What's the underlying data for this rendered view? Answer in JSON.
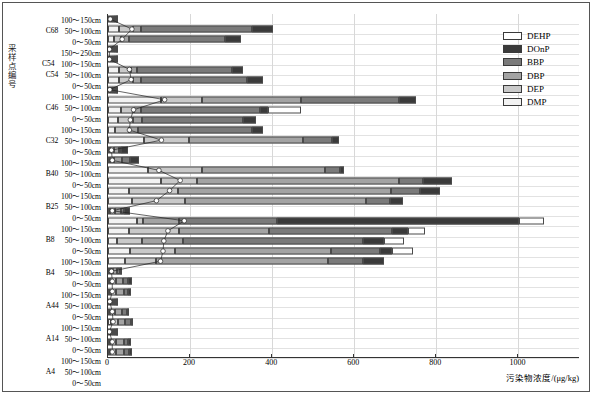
{
  "axes": {
    "y_axis_title": "采样点编号",
    "x_axis_title": "污染物浓度/(μg/kg)",
    "x_ticks": [
      "0",
      "200",
      "400",
      "600",
      "800",
      "1000"
    ]
  },
  "legend": {
    "items": [
      {
        "label": "DEHP",
        "color": "#ffffff"
      },
      {
        "label": "DOnP",
        "color": "#3a3a3a"
      },
      {
        "label": "BBP",
        "color": "#7a7a7a"
      },
      {
        "label": "DBP",
        "color": "#a3a3a3"
      },
      {
        "label": "DEP",
        "color": "#c9c9c9"
      },
      {
        "label": "DMP",
        "color": "#f2f2f2"
      }
    ]
  },
  "chart_data": {
    "type": "bar",
    "orientation": "horizontal",
    "stacked": true,
    "title": "",
    "xlabel": "污染物浓度/(μg/kg)",
    "ylabel": "采样点编号",
    "xlim": [
      0,
      1150
    ],
    "grid": true,
    "legend_position": "top-right",
    "series_order": [
      "DMP",
      "DEP",
      "DBP",
      "BBP",
      "DOnP",
      "DEHP"
    ],
    "series_colors": {
      "DMP": "#f2f2f2",
      "DEP": "#c9c9c9",
      "DBP": "#a3a3a3",
      "BBP": "#7a7a7a",
      "DOnP": "#3a3a3a",
      "DEHP": "#ffffff"
    },
    "categories": [
      {
        "group": "C68",
        "depth": "100～150cm"
      },
      {
        "group": "C68",
        "depth": "50～100cm"
      },
      {
        "group": "C68",
        "depth": "0～50cm"
      },
      {
        "group": "C54",
        "depth": "150～250cm"
      },
      {
        "group": "C54",
        "depth": "100～150cm"
      },
      {
        "group": "C54",
        "depth": "50～100cm"
      },
      {
        "group": "C54",
        "depth": "0～50cm"
      },
      {
        "group": "C46",
        "depth": "100～150cm"
      },
      {
        "group": "C46",
        "depth": "50～100cm"
      },
      {
        "group": "C46",
        "depth": "0～50cm"
      },
      {
        "group": "C32",
        "depth": "100～150cm"
      },
      {
        "group": "C32",
        "depth": "50～100cm"
      },
      {
        "group": "C32",
        "depth": "0～50cm"
      },
      {
        "group": "B40",
        "depth": "100～150cm"
      },
      {
        "group": "B40",
        "depth": "50～100cm"
      },
      {
        "group": "B40",
        "depth": "0～50cm"
      },
      {
        "group": "B25",
        "depth": "100～150cm"
      },
      {
        "group": "B25",
        "depth": "50～100cm"
      },
      {
        "group": "B25",
        "depth": "0～50cm"
      },
      {
        "group": "B8",
        "depth": "100～150cm"
      },
      {
        "group": "B8",
        "depth": "50～100cm"
      },
      {
        "group": "B8",
        "depth": "0～50cm"
      },
      {
        "group": "B4",
        "depth": "100～150cm"
      },
      {
        "group": "B4",
        "depth": "50～100cm"
      },
      {
        "group": "B4",
        "depth": "0～50cm"
      },
      {
        "group": "A44",
        "depth": "100～150cm"
      },
      {
        "group": "A44",
        "depth": "50～100cm"
      },
      {
        "group": "A44",
        "depth": "0～50cm"
      },
      {
        "group": "A14",
        "depth": "100～150cm"
      },
      {
        "group": "A14",
        "depth": "50～100cm"
      },
      {
        "group": "A14",
        "depth": "0～50cm"
      },
      {
        "group": "A4",
        "depth": "100～150cm"
      },
      {
        "group": "A4",
        "depth": "50～100cm"
      },
      {
        "group": "A4",
        "depth": "0～50cm"
      }
    ],
    "rows": [
      {
        "label": "C68 100～150cm",
        "values": {
          "DMP": 3,
          "DEP": 3,
          "DBP": 2,
          "BBP": 2,
          "DOnP": 2,
          "DEHP": 0
        },
        "marker": 5
      },
      {
        "label": "C68 50～100cm",
        "values": {
          "DMP": 28,
          "DEP": 34,
          "DBP": 18,
          "BBP": 270,
          "DOnP": 52,
          "DEHP": 0
        },
        "marker": 58
      },
      {
        "label": "C68 0～50cm",
        "values": {
          "DMP": 14,
          "DEP": 18,
          "DBP": 20,
          "BBP": 233,
          "DOnP": 40,
          "DEHP": 0
        },
        "marker": 34
      },
      {
        "label": "C54 150～250cm",
        "values": {
          "DMP": 2,
          "DEP": 2,
          "DBP": 2,
          "BBP": 1,
          "DOnP": 1,
          "DEHP": 0
        },
        "marker": 3
      },
      {
        "label": "C54 100～150cm",
        "values": {
          "DMP": 2,
          "DEP": 2,
          "DBP": 2,
          "BBP": 1,
          "DOnP": 1,
          "DEHP": 0
        },
        "marker": 3
      },
      {
        "label": "C54 50～100cm",
        "values": {
          "DMP": 26,
          "DEP": 30,
          "DBP": 15,
          "BBP": 230,
          "DOnP": 28,
          "DEHP": 0
        },
        "marker": 52
      },
      {
        "label": "C54 0～50cm",
        "values": {
          "DMP": 28,
          "DEP": 34,
          "DBP": 18,
          "BBP": 258,
          "DOnP": 40,
          "DEHP": 0
        },
        "marker": 56
      },
      {
        "label": "C46 100～150cm",
        "values": {
          "DMP": 2,
          "DEP": 2,
          "DBP": 2,
          "BBP": 2,
          "DOnP": 1,
          "DEHP": 0
        },
        "marker": 4
      },
      {
        "label": "C46 50～100cm",
        "values": {
          "DMP": 130,
          "DEP": 100,
          "DBP": 240,
          "BBP": 240,
          "DOnP": 40,
          "DEHP": 0
        },
        "marker": 138
      },
      {
        "label": "C46 0～50cm",
        "values": {
          "DMP": 32,
          "DEP": 32,
          "DBP": 16,
          "BBP": 290,
          "DOnP": 20,
          "DEHP": 80
        },
        "marker": 62
      },
      {
        "label": "C32 100～150cm",
        "values": {
          "DMP": 24,
          "DEP": 38,
          "DBP": 20,
          "BBP": 246,
          "DOnP": 32,
          "DEHP": 0
        },
        "marker": 54
      },
      {
        "label": "C32 50～100cm",
        "values": {
          "DMP": 18,
          "DEP": 34,
          "DBP": 20,
          "BBP": 280,
          "DOnP": 26,
          "DEHP": 0
        },
        "marker": 52
      },
      {
        "label": "C32 0～50cm",
        "values": {
          "DMP": 88,
          "DEP": 110,
          "DBP": 278,
          "BBP": 70,
          "DOnP": 16,
          "DEHP": 0
        },
        "marker": 130
      },
      {
        "label": "B40 100～150cm",
        "values": {
          "DMP": 4,
          "DEP": 10,
          "DBP": 12,
          "BBP": 6,
          "DOnP": 16,
          "DEHP": 0
        },
        "marker": 8
      },
      {
        "label": "B40 50～100cm",
        "values": {
          "DMP": 4,
          "DEP": 10,
          "DBP": 20,
          "BBP": 20,
          "DOnP": 22,
          "DEHP": 0
        },
        "marker": 10
      },
      {
        "label": "B40 0～50cm",
        "values": {
          "DMP": 98,
          "DEP": 130,
          "DBP": 300,
          "BBP": 38,
          "DOnP": 8,
          "DEHP": 0
        },
        "marker": 124
      },
      {
        "label": "B25 100～150cm",
        "values": {
          "DMP": 128,
          "DEP": 90,
          "DBP": 490,
          "BBP": 60,
          "DOnP": 70,
          "DEHP": 0
        },
        "marker": 176
      },
      {
        "label": "B25 50～100cm",
        "values": {
          "DMP": 50,
          "DEP": 120,
          "DBP": 520,
          "BBP": 70,
          "DOnP": 50,
          "DEHP": 0
        },
        "marker": 150
      },
      {
        "label": "B25 0～50cm",
        "values": {
          "DMP": 58,
          "DEP": 130,
          "DBP": 440,
          "BBP": 60,
          "DOnP": 30,
          "DEHP": 0
        },
        "marker": 118
      },
      {
        "label": "B8 100～150cm",
        "values": {
          "DMP": 6,
          "DEP": 12,
          "DBP": 14,
          "BBP": 6,
          "DOnP": 16,
          "DEHP": 0
        },
        "marker": 10
      },
      {
        "label": "B8 50～100cm",
        "values": {
          "DMP": 70,
          "DEP": 16,
          "DBP": 86,
          "BBP": 240,
          "DOnP": 590,
          "DEHP": 60
        },
        "marker": 186
      },
      {
        "label": "B8 0～50cm",
        "values": {
          "DMP": 52,
          "DEP": 120,
          "DBP": 220,
          "BBP": 300,
          "DOnP": 40,
          "DEHP": 40
        },
        "marker": 146
      },
      {
        "label": "B4 100～150cm",
        "values": {
          "DMP": 22,
          "DEP": 60,
          "DBP": 100,
          "BBP": 440,
          "DOnP": 50,
          "DEHP": 50
        },
        "marker": 136
      },
      {
        "label": "B4 50～100cm",
        "values": {
          "DMP": 54,
          "DEP": 110,
          "DBP": 380,
          "BBP": 118,
          "DOnP": 30,
          "DEHP": 50
        },
        "marker": 134
      },
      {
        "label": "B4 0～50cm",
        "values": {
          "DMP": 42,
          "DEP": 74,
          "DBP": 420,
          "BBP": 86,
          "DOnP": 50,
          "DEHP": 0
        },
        "marker": 128
      },
      {
        "label": "A44 100～150cm",
        "values": {
          "DMP": 4,
          "DEP": 8,
          "DBP": 10,
          "BBP": 8,
          "DOnP": 4,
          "DEHP": 0
        },
        "marker": 8
      },
      {
        "label": "A44 50～100cm",
        "values": {
          "DMP": 6,
          "DEP": 14,
          "DBP": 16,
          "BBP": 14,
          "DOnP": 8,
          "DEHP": 0
        },
        "marker": 10
      },
      {
        "label": "A44 0～50cm",
        "values": {
          "DMP": 6,
          "DEP": 14,
          "DBP": 18,
          "BBP": 12,
          "DOnP": 6,
          "DEHP": 0
        },
        "marker": 10
      },
      {
        "label": "A14 100～150cm",
        "values": {
          "DMP": 2,
          "DEP": 4,
          "DBP": 4,
          "BBP": 2,
          "DOnP": 2,
          "DEHP": 0
        },
        "marker": 4
      },
      {
        "label": "A14 50～100cm",
        "values": {
          "DMP": 6,
          "DEP": 12,
          "DBP": 16,
          "BBP": 12,
          "DOnP": 6,
          "DEHP": 0
        },
        "marker": 10
      },
      {
        "label": "A14 0～50cm",
        "values": {
          "DMP": 8,
          "DEP": 16,
          "DBP": 18,
          "BBP": 14,
          "DOnP": 6,
          "DEHP": 0
        },
        "marker": 12
      },
      {
        "label": "A4 100～150cm",
        "values": {
          "DMP": 2,
          "DEP": 2,
          "DBP": 2,
          "BBP": 2,
          "DOnP": 1,
          "DEHP": 0
        },
        "marker": 3
      },
      {
        "label": "A4 50～100cm",
        "values": {
          "DMP": 6,
          "DEP": 14,
          "DBP": 18,
          "BBP": 12,
          "DOnP": 6,
          "DEHP": 0
        },
        "marker": 10
      },
      {
        "label": "A4 0～50cm",
        "values": {
          "DMP": 6,
          "DEP": 14,
          "DBP": 18,
          "BBP": 14,
          "DOnP": 6,
          "DEHP": 0
        },
        "marker": 10
      }
    ]
  }
}
